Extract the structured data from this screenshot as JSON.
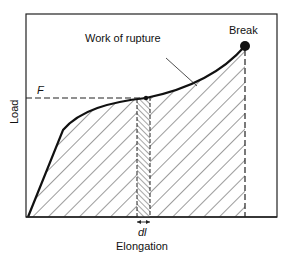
{
  "diagram": {
    "type": "load-elongation curve",
    "labels": {
      "work_of_rupture": "Work of rupture",
      "break": "Break",
      "force": "F",
      "y_axis": "Load",
      "x_axis": "Elongation",
      "increment": "dl"
    },
    "colors": {
      "ink": "#111111",
      "background": "#ffffff"
    }
  }
}
